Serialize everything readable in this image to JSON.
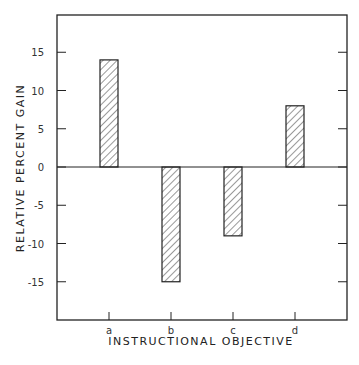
{
  "chart_data": {
    "type": "bar",
    "title": "",
    "xlabel": "INSTRUCTIONAL OBJECTIVE",
    "ylabel": "RELATIVE PERCENT GAIN",
    "categories": [
      "a",
      "b",
      "c",
      "d"
    ],
    "values": [
      14,
      -15,
      -9,
      8
    ],
    "yticks": [
      15,
      10,
      5,
      0,
      -5,
      -10,
      -15
    ],
    "ytick_labels": [
      "15",
      "10",
      "5",
      "0",
      "-5",
      "-10",
      "-15"
    ],
    "ylim": [
      -20,
      20
    ],
    "grid": false,
    "legend": null,
    "bar_fill": "diagonal hatch"
  }
}
